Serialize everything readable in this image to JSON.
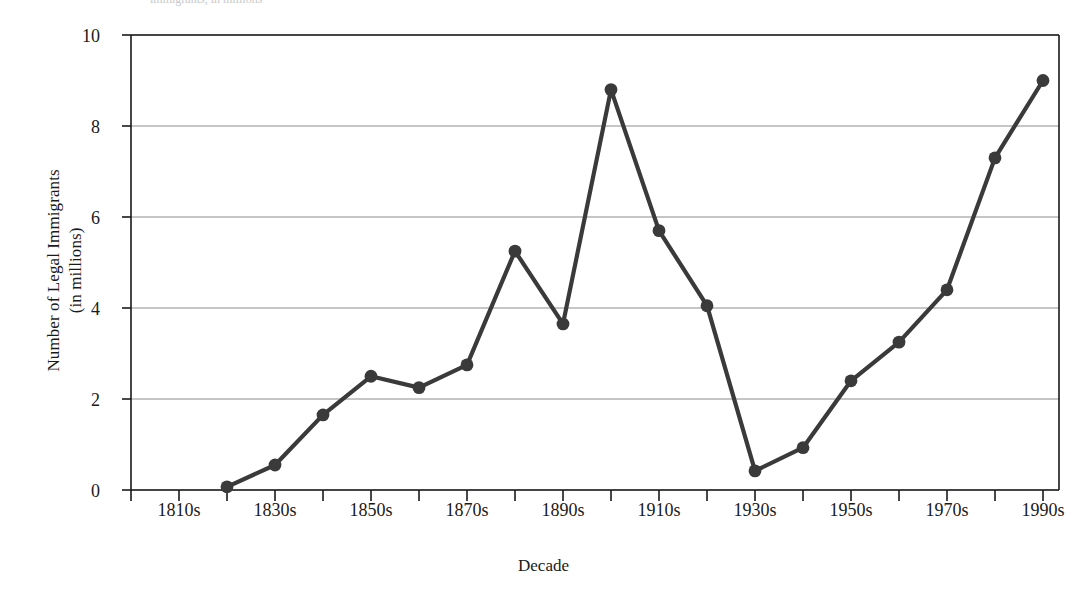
{
  "figure": {
    "clipped_header_text": "immigrants, in millions",
    "background": "#ffffff",
    "ink_color": "#1a1a1a",
    "grid_color": "#8c8c8c",
    "series_color": "#3a3a3a"
  },
  "axis": {
    "y_title": "Number of Legal Immigrants\n(in millions)",
    "x_title": "Decade",
    "y_ticks": [
      "0",
      "2",
      "4",
      "6",
      "8",
      "10"
    ],
    "x_ticks": [
      "1810s",
      "1830s",
      "1850s",
      "1870s",
      "1890s",
      "1910s",
      "1930s",
      "1950s",
      "1970s",
      "1990s"
    ]
  },
  "chart_data": {
    "type": "line",
    "title": "",
    "subtitle": "",
    "xlabel": "Decade",
    "ylabel": "Number of Legal Immigrants (in millions)",
    "xlim": [
      "1800s",
      "2000s"
    ],
    "ylim": [
      0,
      10
    ],
    "yticks": [
      0,
      2,
      4,
      6,
      8,
      10
    ],
    "grid": "horizontal",
    "legend": "none",
    "markers": "filled-circle",
    "categories": [
      "1820s",
      "1830s",
      "1840s",
      "1850s",
      "1860s",
      "1870s",
      "1880s",
      "1890s",
      "1900s",
      "1910s",
      "1920s",
      "1930s",
      "1940s",
      "1950s",
      "1960s",
      "1970s",
      "1980s",
      "1990s"
    ],
    "xtick_labels_shown": [
      "1810s",
      "1830s",
      "1850s",
      "1870s",
      "1890s",
      "1910s",
      "1930s",
      "1950s",
      "1970s",
      "1990s"
    ],
    "series": [
      {
        "name": "Legal immigrants (millions)",
        "values": [
          0.07,
          0.55,
          1.65,
          2.5,
          2.25,
          2.75,
          5.25,
          3.65,
          8.8,
          5.7,
          4.05,
          0.42,
          0.93,
          2.4,
          3.25,
          4.4,
          7.3,
          9.0
        ]
      }
    ]
  }
}
